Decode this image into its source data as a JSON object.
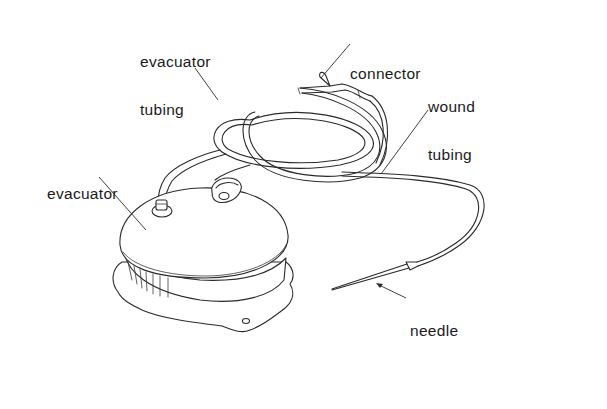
{
  "diagram": {
    "type": "labeled-illustration",
    "labels": [
      {
        "id": "evacuator-tubing",
        "text_line1": "evacuator",
        "text_line2": "tubing"
      },
      {
        "id": "connector",
        "text_line1": "connector"
      },
      {
        "id": "wound-tubing",
        "text_line1": "wound",
        "text_line2": "tubing"
      },
      {
        "id": "evacuator",
        "text_line1": "evacuator"
      },
      {
        "id": "needle",
        "text_line1": "needle"
      }
    ],
    "colors": {
      "ink": "#2a2a2a",
      "background": "#ffffff",
      "text": "#1a1a1a"
    }
  }
}
